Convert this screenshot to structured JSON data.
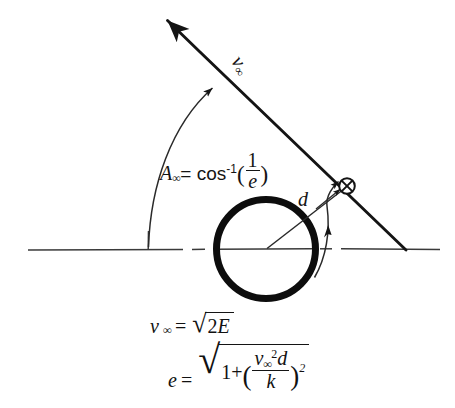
{
  "figure": {
    "background_color": "#ffffff",
    "ink_color": "#141414"
  },
  "labels": {
    "angle": {
      "symbol": "A",
      "symbol_subscript": "∞",
      "equals": "= cos",
      "exponent": "-1",
      "open_paren": "(",
      "fraction_numerator": "1",
      "fraction_denominator": "e",
      "close_paren": ")",
      "full_text": "A∞ = cos⁻¹(1/e)"
    },
    "velocity": {
      "symbol": "v",
      "subscript": "∞",
      "full_text": "v∞"
    },
    "impact_parameter": {
      "symbol": "d",
      "full_text": "d"
    }
  },
  "equations": [
    {
      "name": "velocity-at-infinity",
      "lhs": "v",
      "lhs_subscript": "∞",
      "equals": "=",
      "radical_sign": "√",
      "radicand_coefficient": "2",
      "radicand_variable": "E",
      "full_text": "v∞ = √(2E)"
    },
    {
      "name": "eccentricity",
      "lhs": "e",
      "equals": "=",
      "radical_sign": "√",
      "radicand_one": "1",
      "radicand_plus": "+",
      "open_paren": "(",
      "numerator_variable": "v",
      "numerator_subscript": "∞",
      "numerator_exponent": "2",
      "numerator_factor": "d",
      "denominator": "k",
      "close_paren": ")",
      "outer_exponent": "2",
      "full_text": "e = √(1 + (v∞² d / k)²)"
    }
  ],
  "shapes": {
    "central_body": {
      "name": "planet-circle",
      "center_x": 266,
      "center_y": 249,
      "radius": 50,
      "stroke_width": 7
    },
    "axis_line": {
      "name": "horizontal-axis",
      "style": "dash-dot",
      "y": 249,
      "x_start": 28,
      "x_end": 440
    },
    "asymptote": {
      "name": "asymptote-line",
      "x1": 166,
      "y1": 19,
      "x2": 406,
      "y2": 250,
      "arrowhead": "up-left"
    },
    "angle_arc": {
      "name": "angle-arc",
      "start_x": 148,
      "start_y": 247,
      "end_x": 214,
      "end_y": 86,
      "arrowhead": "at-asymptote"
    },
    "true_anomaly_arc": {
      "name": "true-anomaly-arc",
      "start_x": 316,
      "start_y": 277,
      "end_x": 339,
      "end_y": 180,
      "arrowheads": "double"
    },
    "radius_line": {
      "name": "radius-vector",
      "x1": 266,
      "y1": 249,
      "x2": 345,
      "y2": 188
    },
    "body_marker": {
      "name": "crossed-circle-marker",
      "center_x": 347,
      "center_y": 186,
      "radius": 8,
      "glyph": "⊗"
    },
    "axis_tick": {
      "name": "axis-vertical-tick",
      "x": 148,
      "y_top": 232,
      "y_bottom": 250
    }
  }
}
